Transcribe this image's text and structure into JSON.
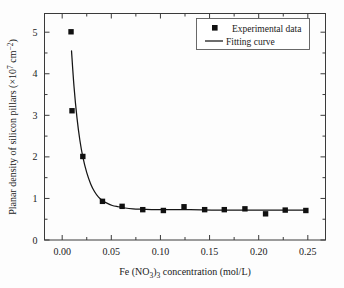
{
  "chart_data": {
    "type": "scatter",
    "title": "",
    "xlabel": "Fe (NO3)3 concentration (mol/L)",
    "xlabel_parts": {
      "prefix": "Fe (NO",
      "sub1": "3",
      "mid": ")",
      "sub2": "3",
      "suffix": " concentration (mol/L)"
    },
    "ylabel": "Planar density of silicon pillars (×10⁷ cm⁻²)",
    "ylabel_parts": {
      "prefix": "Planar density of silicon pillars (×10",
      "sup1": "7",
      "mid": " cm",
      "sup2": "−2",
      "suffix": ")"
    },
    "xlim": [
      -0.018,
      0.268
    ],
    "ylim": [
      0,
      5.45
    ],
    "xticks": [
      0.0,
      0.05,
      0.1,
      0.15,
      0.2,
      0.25
    ],
    "xtick_labels": [
      "0.00",
      "0.05",
      "0.10",
      "0.15",
      "0.20",
      "0.25"
    ],
    "yticks": [
      0,
      1,
      2,
      3,
      4,
      5
    ],
    "ytick_labels": [
      "0",
      "1",
      "2",
      "3",
      "4",
      "5"
    ],
    "x_minor_ticks": [
      0.025,
      0.075,
      0.125,
      0.175,
      0.225
    ],
    "y_minor_ticks": [
      0.5,
      1.5,
      2.5,
      3.5,
      4.5
    ],
    "grid": false,
    "legend_position": "top-right",
    "legend": [
      {
        "label": "Experimental data",
        "marker": "square",
        "color": "#101010"
      },
      {
        "label": "Fitting curve",
        "marker": "line",
        "color": "#151515"
      }
    ],
    "series": [
      {
        "name": "Experimental data",
        "marker": "square",
        "color": "#101010",
        "points": [
          {
            "x": 0.009,
            "y": 5.01
          },
          {
            "x": 0.01,
            "y": 3.11
          },
          {
            "x": 0.021,
            "y": 2.01
          },
          {
            "x": 0.041,
            "y": 0.93
          },
          {
            "x": 0.061,
            "y": 0.81
          },
          {
            "x": 0.082,
            "y": 0.73
          },
          {
            "x": 0.103,
            "y": 0.71
          },
          {
            "x": 0.124,
            "y": 0.8
          },
          {
            "x": 0.145,
            "y": 0.73
          },
          {
            "x": 0.165,
            "y": 0.73
          },
          {
            "x": 0.186,
            "y": 0.75
          },
          {
            "x": 0.207,
            "y": 0.63
          },
          {
            "x": 0.227,
            "y": 0.72
          },
          {
            "x": 0.248,
            "y": 0.71
          }
        ]
      },
      {
        "name": "Fitting curve",
        "marker": "line",
        "color": "#151515",
        "model": "exponential-decay-plus-offset",
        "x_start": 0.0095,
        "x_end": 0.249,
        "points": [
          {
            "x": 0.0095,
            "y": 4.55
          },
          {
            "x": 0.012,
            "y": 3.7
          },
          {
            "x": 0.015,
            "y": 2.95
          },
          {
            "x": 0.018,
            "y": 2.4
          },
          {
            "x": 0.021,
            "y": 2.0
          },
          {
            "x": 0.025,
            "y": 1.62
          },
          {
            "x": 0.029,
            "y": 1.35
          },
          {
            "x": 0.033,
            "y": 1.16
          },
          {
            "x": 0.037,
            "y": 1.03
          },
          {
            "x": 0.041,
            "y": 0.95
          },
          {
            "x": 0.046,
            "y": 0.88
          },
          {
            "x": 0.051,
            "y": 0.83
          },
          {
            "x": 0.057,
            "y": 0.8
          },
          {
            "x": 0.064,
            "y": 0.77
          },
          {
            "x": 0.072,
            "y": 0.75
          },
          {
            "x": 0.082,
            "y": 0.74
          },
          {
            "x": 0.095,
            "y": 0.73
          },
          {
            "x": 0.11,
            "y": 0.73
          },
          {
            "x": 0.13,
            "y": 0.73
          },
          {
            "x": 0.16,
            "y": 0.72
          },
          {
            "x": 0.2,
            "y": 0.72
          },
          {
            "x": 0.249,
            "y": 0.72
          }
        ]
      }
    ]
  }
}
